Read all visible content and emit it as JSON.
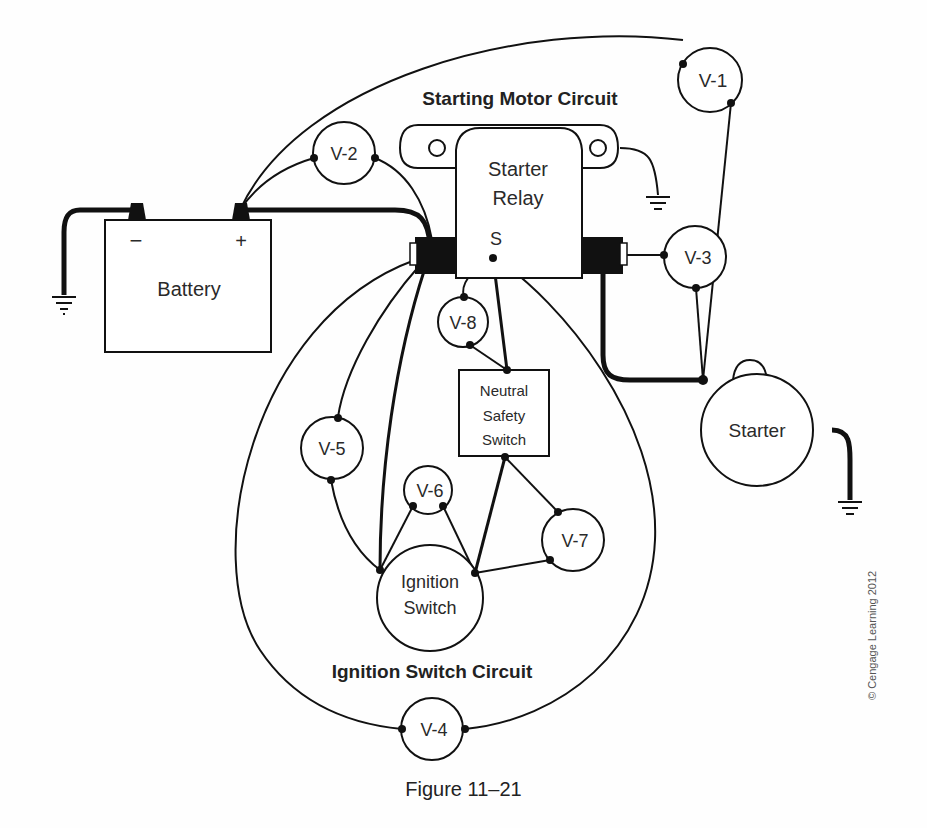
{
  "titles": {
    "top": "Starting Motor Circuit",
    "bottom": "Ignition Switch Circuit"
  },
  "components": {
    "battery": {
      "label": "Battery",
      "neg": "−",
      "pos": "+"
    },
    "relay": {
      "line1": "Starter",
      "line2": "Relay",
      "terminal": "S"
    },
    "starter": {
      "label": "Starter"
    },
    "neutral_switch": {
      "line1": "Neutral",
      "line2": "Safety",
      "line3": "Switch"
    },
    "ignition_switch": {
      "line1": "Ignition",
      "line2": "Switch"
    }
  },
  "voltmeters": [
    "V-1",
    "V-2",
    "V-3",
    "V-4",
    "V-5",
    "V-6",
    "V-7",
    "V-8"
  ],
  "caption": "Figure 11–21",
  "copyright": "© Cengage Learning 2012"
}
